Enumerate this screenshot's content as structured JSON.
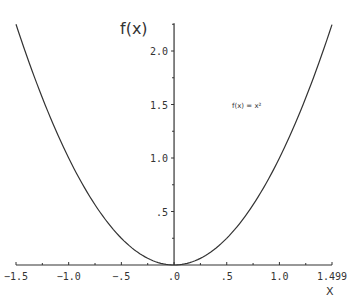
{
  "chart_data": {
    "type": "line",
    "title": "",
    "xlabel": "X",
    "ylabel": "f(x)",
    "xlim": [
      -1.5,
      1.499
    ],
    "ylim": [
      0,
      2.25
    ],
    "grid": false,
    "legend_position": "inside-right",
    "x_ticks": [
      {
        "value": -1.5,
        "label": "−1.5"
      },
      {
        "value": -1.0,
        "label": "−1.0"
      },
      {
        "value": -0.5,
        "label": "−.5"
      },
      {
        "value": 0.0,
        "label": ".0"
      },
      {
        "value": 0.5,
        "label": ".5"
      },
      {
        "value": 1.0,
        "label": "1.0"
      },
      {
        "value": 1.499,
        "label": "1.499"
      }
    ],
    "x_minor_ticks": [
      -1.25,
      -0.75,
      -0.25,
      0.25,
      0.75,
      1.25
    ],
    "y_ticks": [
      {
        "value": 0.5,
        "label": ".5"
      },
      {
        "value": 1.0,
        "label": "1.0"
      },
      {
        "value": 1.5,
        "label": "1.5"
      },
      {
        "value": 2.0,
        "label": "2.0"
      }
    ],
    "y_minor_ticks": [
      0.25,
      0.75,
      1.25,
      1.75,
      2.25
    ],
    "series": [
      {
        "name": "f(x) = x²",
        "function": "x^2",
        "x": [
          -1.5,
          -1.25,
          -1.0,
          -0.75,
          -0.5,
          -0.25,
          0.0,
          0.25,
          0.5,
          0.75,
          1.0,
          1.25,
          1.499
        ],
        "values": [
          2.25,
          1.5625,
          1.0,
          0.5625,
          0.25,
          0.0625,
          0.0,
          0.0625,
          0.25,
          0.5625,
          1.0,
          1.5625,
          2.247
        ],
        "color": "#333333"
      }
    ],
    "annotations": [
      {
        "text": "f(x) = x²",
        "x": 0.55,
        "y": 1.55
      }
    ]
  }
}
